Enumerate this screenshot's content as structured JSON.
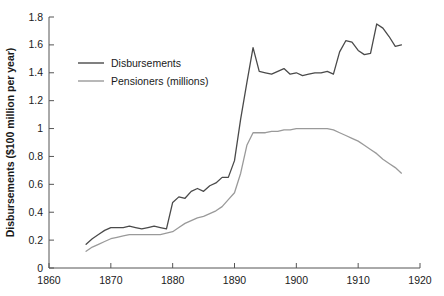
{
  "chart_data": {
    "type": "line",
    "title": "",
    "xlabel": "",
    "ylabel": "Disbursements ($100 million per year)",
    "xlim": [
      1860,
      1920
    ],
    "ylim": [
      0,
      1.8
    ],
    "xticks": [
      1860,
      1870,
      1880,
      1890,
      1900,
      1910,
      1920
    ],
    "xtick_labels": [
      "1860",
      "1870",
      "1880",
      "1890",
      "1900",
      "1910",
      "1920"
    ],
    "yticks": [
      0,
      0.2,
      0.4,
      0.6,
      0.8,
      1,
      1.2,
      1.4,
      1.6,
      1.8
    ],
    "ytick_labels": [
      "0",
      "0.2",
      "0.4",
      "0.6",
      "0.8",
      "1",
      "1.2",
      "1.4",
      "1.6",
      "1.8"
    ],
    "grid": false,
    "legend_position": "upper-left",
    "series": [
      {
        "name": "Disbursements",
        "color": "#4a4a4a",
        "x": [
          1866,
          1867,
          1868,
          1869,
          1870,
          1871,
          1872,
          1873,
          1874,
          1875,
          1876,
          1877,
          1878,
          1879,
          1880,
          1881,
          1882,
          1883,
          1884,
          1885,
          1886,
          1887,
          1888,
          1889,
          1890,
          1891,
          1892,
          1893,
          1894,
          1895,
          1896,
          1897,
          1898,
          1899,
          1900,
          1901,
          1902,
          1903,
          1904,
          1905,
          1906,
          1907,
          1908,
          1909,
          1910,
          1911,
          1912,
          1913,
          1914,
          1915,
          1916,
          1917
        ],
        "values": [
          0.17,
          0.21,
          0.24,
          0.27,
          0.29,
          0.29,
          0.29,
          0.3,
          0.29,
          0.28,
          0.29,
          0.3,
          0.29,
          0.28,
          0.47,
          0.51,
          0.5,
          0.55,
          0.57,
          0.55,
          0.59,
          0.61,
          0.65,
          0.65,
          0.77,
          1.07,
          1.33,
          1.58,
          1.41,
          1.4,
          1.39,
          1.41,
          1.43,
          1.39,
          1.4,
          1.38,
          1.39,
          1.4,
          1.4,
          1.41,
          1.39,
          1.55,
          1.63,
          1.62,
          1.56,
          1.53,
          1.54,
          1.75,
          1.72,
          1.66,
          1.59,
          1.6
        ]
      },
      {
        "name": "Pensioners (millions)",
        "color": "#9a9a9a",
        "x": [
          1866,
          1867,
          1868,
          1869,
          1870,
          1871,
          1872,
          1873,
          1874,
          1875,
          1876,
          1877,
          1878,
          1879,
          1880,
          1881,
          1882,
          1883,
          1884,
          1885,
          1886,
          1887,
          1888,
          1889,
          1890,
          1891,
          1892,
          1893,
          1894,
          1895,
          1896,
          1897,
          1898,
          1899,
          1900,
          1901,
          1902,
          1903,
          1904,
          1905,
          1906,
          1907,
          1908,
          1909,
          1910,
          1911,
          1912,
          1913,
          1914,
          1915,
          1916,
          1917
        ],
        "values": [
          0.12,
          0.15,
          0.17,
          0.19,
          0.21,
          0.22,
          0.23,
          0.24,
          0.24,
          0.24,
          0.24,
          0.24,
          0.24,
          0.25,
          0.26,
          0.29,
          0.32,
          0.34,
          0.36,
          0.37,
          0.39,
          0.41,
          0.44,
          0.49,
          0.54,
          0.68,
          0.88,
          0.97,
          0.97,
          0.97,
          0.98,
          0.98,
          0.99,
          0.99,
          1.0,
          1.0,
          1.0,
          1.0,
          1.0,
          1.0,
          0.99,
          0.97,
          0.95,
          0.93,
          0.91,
          0.88,
          0.85,
          0.82,
          0.78,
          0.75,
          0.72,
          0.68
        ]
      }
    ]
  },
  "legend": {
    "items": [
      {
        "label": "Disbursements",
        "color": "#4a4a4a"
      },
      {
        "label": "Pensioners (millions)",
        "color": "#9a9a9a"
      }
    ]
  }
}
